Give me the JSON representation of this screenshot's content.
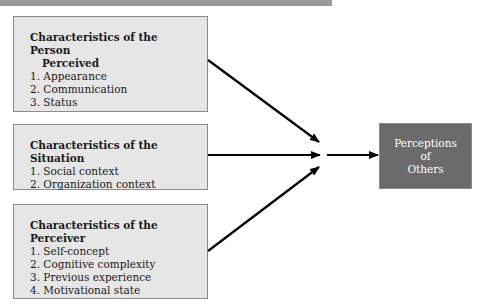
{
  "diagram": {
    "inputs": [
      {
        "title_line1": "Characteristics of the Person",
        "title_line2": "Perceived",
        "items": [
          "1. Appearance",
          "2. Communication",
          "3. Status"
        ]
      },
      {
        "title_line1": "Characteristics of the Situation",
        "title_line2": "",
        "items": [
          "1. Social context",
          "2. Organization context"
        ]
      },
      {
        "title_line1": "Characteristics of the Perceiver",
        "title_line2": "",
        "items": [
          "1. Self-concept",
          "2. Cognitive complexity",
          "3. Previous experience",
          "4. Motivational state"
        ]
      }
    ],
    "output": {
      "lines": [
        "Perceptions",
        "of",
        "Others"
      ]
    },
    "colors": {
      "input_box_fill": "#e6e6e6",
      "input_box_border": "#8c8c8c",
      "output_box_fill": "#6b6b6b",
      "output_text": "#ffffff",
      "arrow": "#000000",
      "top_bar": "#9a9a9a"
    }
  }
}
